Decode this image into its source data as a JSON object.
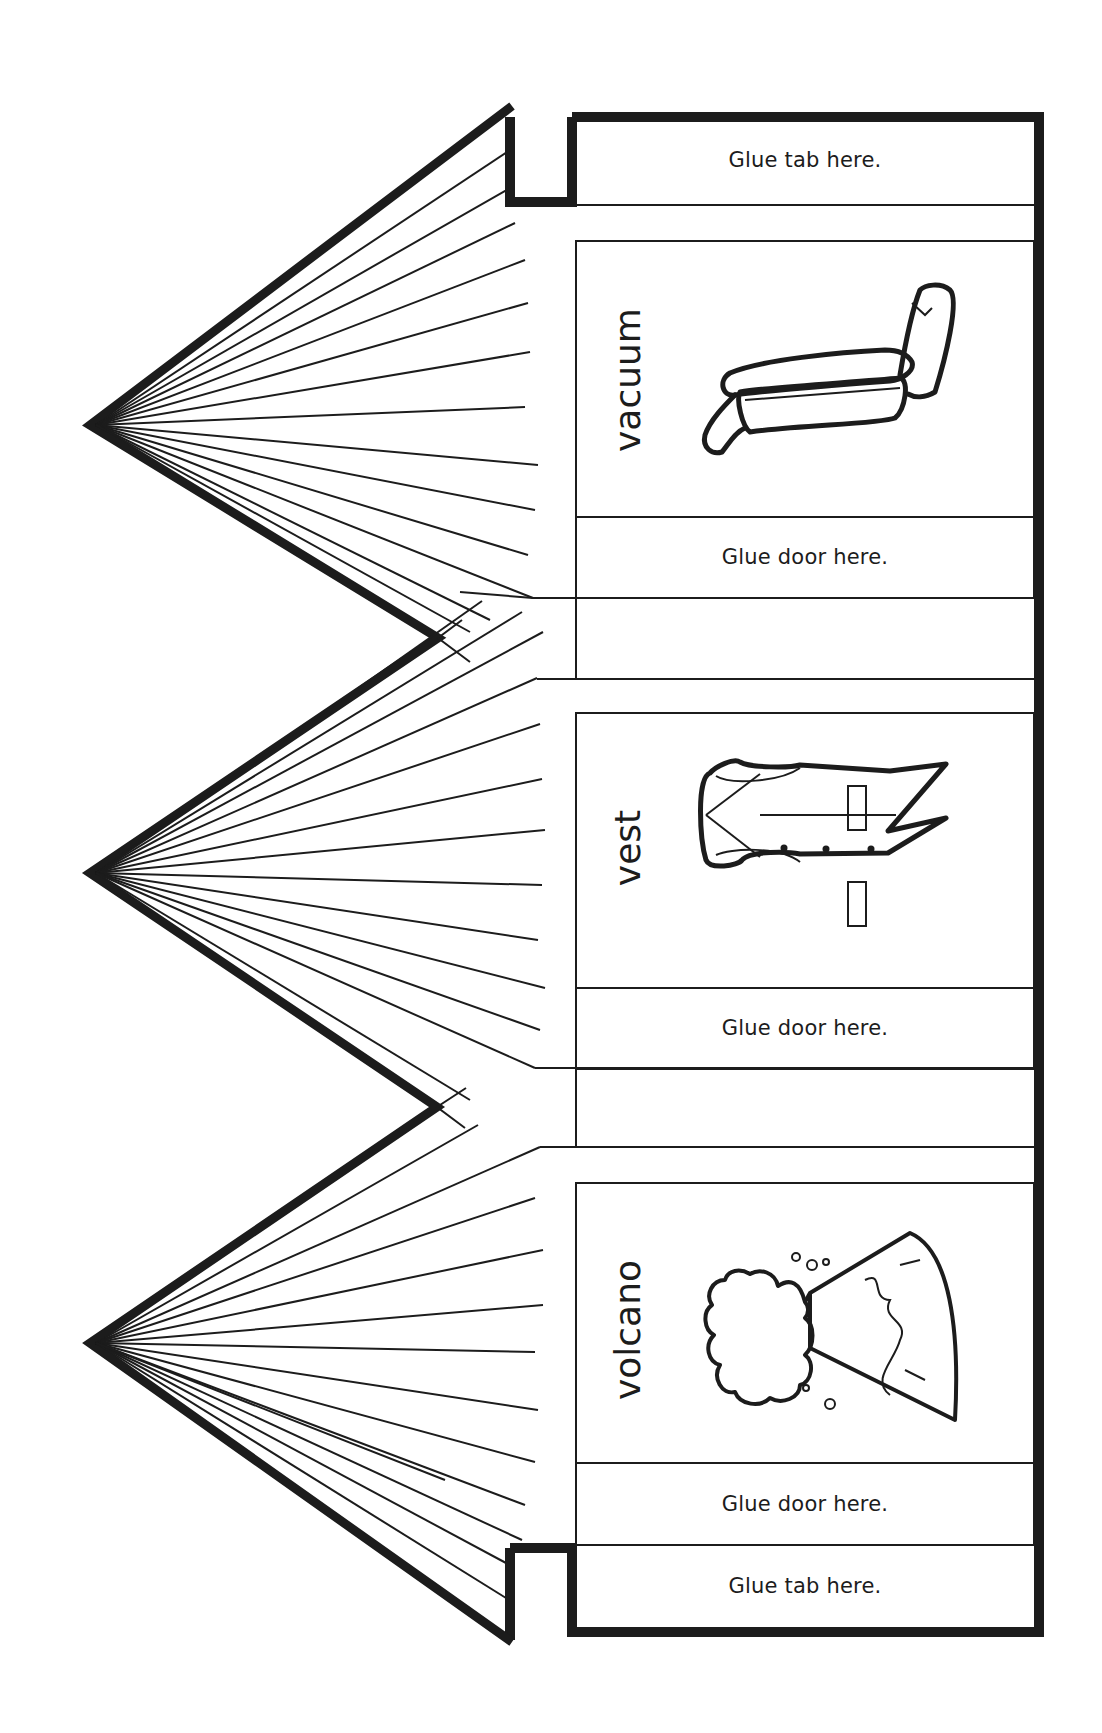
{
  "worksheet": {
    "type": "fold-and-glue door craft template",
    "colors": {
      "ink": "#1c1c1c",
      "paper": "#ffffff"
    },
    "tabs": [
      {
        "label": "Glue tab here.",
        "position": "top"
      },
      {
        "label": "Glue tab here.",
        "position": "bottom"
      }
    ],
    "panels": [
      {
        "word": "vacuum",
        "icon": "vacuum-icon",
        "glue_label": "Glue door here."
      },
      {
        "word": "vest",
        "icon": "vest-icon",
        "glue_label": "Glue door here."
      },
      {
        "word": "volcano",
        "icon": "volcano-icon",
        "glue_label": "Glue door here."
      }
    ],
    "doors": [
      {
        "shape": "triangle-with-rays",
        "icon": "door-rays-icon"
      },
      {
        "shape": "triangle-with-rays",
        "icon": "door-rays-icon"
      },
      {
        "shape": "triangle-with-rays",
        "icon": "door-rays-icon"
      }
    ]
  }
}
